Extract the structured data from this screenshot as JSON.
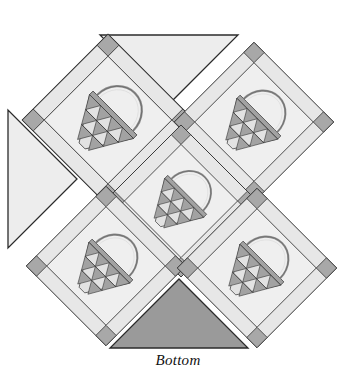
{
  "figure": {
    "caption": "Bottom",
    "type": "quilt-layout-diagram"
  },
  "colors": {
    "page_background": "#ffffff",
    "block_background": "#eeeeee",
    "sashing_light": "#e7e7e7",
    "corner_square": "#a8a8a8",
    "basket_fill": "#a2a2a2",
    "basket_light": "#e2e2e2",
    "setting_triangle_light": "#ededed",
    "setting_triangle_dark": "#9a9a9a",
    "outline": "#2b2b2b",
    "handle": "#888888",
    "label_text": "#111111"
  },
  "blocks": [
    {
      "id": "block-top-left",
      "name": "basket-block-top-left",
      "center_x": 108,
      "center_y": 120,
      "half": 86,
      "rotation": 45,
      "basket": "basket-motif"
    },
    {
      "id": "block-top-right",
      "name": "basket-block-top-right",
      "center_x": 252,
      "center_y": 122,
      "half": 80,
      "rotation": 45,
      "basket": "basket-motif"
    },
    {
      "id": "block-center",
      "name": "basket-block-center",
      "center_x": 181,
      "center_y": 200,
      "half": 76,
      "rotation": 45,
      "basket": "basket-motif"
    },
    {
      "id": "block-bottom-left",
      "name": "basket-block-bottom-left",
      "center_x": 108,
      "center_y": 268,
      "half": 80,
      "rotation": 45,
      "basket": "basket-motif"
    },
    {
      "id": "block-bottom-right",
      "name": "basket-block-bottom-right",
      "center_x": 256,
      "center_y": 268,
      "half": 80,
      "rotation": 45,
      "basket": "basket-motif"
    }
  ],
  "setting_triangles": [
    {
      "id": "setting-top",
      "name": "setting-triangle-top",
      "shade": "light"
    },
    {
      "id": "setting-left",
      "name": "setting-triangle-left",
      "shade": "light"
    },
    {
      "id": "setting-bottom",
      "name": "setting-triangle-bottom",
      "shade": "dark"
    }
  ],
  "basket_motif": {
    "handle_label": "basket-handle-arc",
    "rim_label": "basket-rim-bar",
    "body_label": "basket-body-lattice",
    "lattice_rows": 3,
    "lattice_row_counts": [
      4,
      3,
      1
    ],
    "description": "Arched handle over a trapezoidal body filled with a pieced triangle lattice"
  },
  "corner_squares": {
    "name": "corner-square-diamond",
    "count_per_block": 4,
    "shape": "square"
  }
}
